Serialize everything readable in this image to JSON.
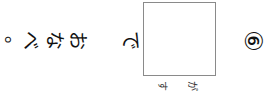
{
  "worksheet": {
    "question_number": "⑥",
    "sentence_before_box": "で",
    "answer_box": {
      "value": "",
      "furigana": [
        "す",
        "が"
      ]
    },
    "sentence_after": [
      "お",
      "な",
      "べ",
      "。"
    ],
    "orientation": "rotated 90° (vertical Japanese text)"
  }
}
